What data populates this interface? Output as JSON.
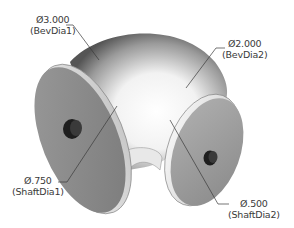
{
  "model": {
    "description": "Elbow pipe with two flanged ends and shaft bores",
    "colors": {
      "flange_face": "#8c8c8c",
      "bore": "#2a2a2a",
      "pipe_highlight": "#ffffff",
      "pipe_shadow": "#5a5a5a",
      "leader": "#3a3a3a",
      "text": "#3a3a3a"
    }
  },
  "dimensions": [
    {
      "id": "bevdia1",
      "value": "Ø3.000",
      "name": "(BevDia1)"
    },
    {
      "id": "bevdia2",
      "value": "Ø2.000",
      "name": "(BevDia2)"
    },
    {
      "id": "shaftdia1",
      "value": "Ø.750",
      "name": "(ShaftDia1)"
    },
    {
      "id": "shaftdia2",
      "value": "Ø.500",
      "name": "(ShaftDia2)"
    }
  ]
}
